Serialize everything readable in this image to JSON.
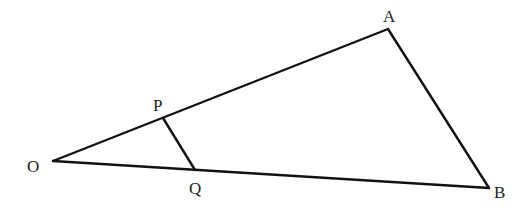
{
  "diagram": {
    "type": "geometry",
    "stroke_color": "#111111",
    "label_color": "#222222",
    "points": {
      "O": {
        "label": "O",
        "x": 53,
        "y": 161
      },
      "P": {
        "label": "P",
        "x": 163,
        "y": 118
      },
      "Q": {
        "label": "Q",
        "x": 195,
        "y": 170
      },
      "A": {
        "label": "A",
        "x": 388,
        "y": 29
      },
      "B": {
        "label": "B",
        "x": 489,
        "y": 188
      }
    },
    "segments": [
      {
        "name": "OA",
        "from": "O",
        "to": "A"
      },
      {
        "name": "AB",
        "from": "A",
        "to": "B"
      },
      {
        "name": "OB",
        "from": "O",
        "to": "B"
      },
      {
        "name": "PQ",
        "from": "P",
        "to": "Q"
      }
    ]
  }
}
